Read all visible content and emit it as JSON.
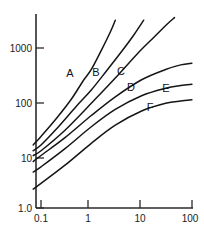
{
  "chart_data": {
    "type": "line",
    "title": "",
    "xlabel": "",
    "ylabel": "",
    "xscale": "log",
    "yscale": "log",
    "xlim": [
      0.07,
      100
    ],
    "ylim": [
      1.0,
      4000
    ],
    "grid": false,
    "legend": "inline-curve-labels",
    "x_tick_labels": [
      "0.1",
      "1",
      "10",
      "100"
    ],
    "x_tick_values": [
      0.1,
      1,
      10,
      100
    ],
    "y_tick_labels": [
      "1.0",
      "10",
      "100",
      "1000"
    ],
    "y_tick_values": [
      1,
      10,
      100,
      1000
    ],
    "series": [
      {
        "name": "A",
        "label": "A",
        "x": [
          0.07,
          0.1,
          0.2,
          0.4,
          0.7,
          1.0,
          1.6,
          2.4,
          3.0
        ],
        "values": [
          14,
          20,
          42,
          95,
          210,
          330,
          750,
          1600,
          2600
        ]
      },
      {
        "name": "B",
        "label": "B",
        "x": [
          0.07,
          0.1,
          0.2,
          0.5,
          1.0,
          2.0,
          4.0,
          7.0,
          11.0
        ],
        "values": [
          11,
          14,
          27,
          70,
          140,
          310,
          700,
          1400,
          2600
        ]
      },
      {
        "name": "C",
        "label": "C",
        "x": [
          0.07,
          0.1,
          0.3,
          1.0,
          3.0,
          8.0,
          18.0,
          32.0,
          45.0
        ],
        "values": [
          9,
          11,
          26,
          80,
          230,
          620,
          1300,
          2200,
          2900
        ]
      },
      {
        "name": "D",
        "label": "D",
        "x": [
          0.07,
          0.1,
          0.3,
          1.0,
          3.0,
          10.0,
          30.0,
          60.0,
          100.0
        ],
        "values": [
          7,
          9,
          19,
          48,
          105,
          215,
          330,
          400,
          430
        ]
      },
      {
        "name": "E",
        "label": "E",
        "x": [
          0.07,
          0.1,
          0.3,
          1.0,
          3.0,
          10.0,
          30.0,
          60.0,
          100.0
        ],
        "values": [
          4.5,
          5.6,
          12,
          30,
          62,
          110,
          150,
          168,
          178
        ]
      },
      {
        "name": "F",
        "label": "F",
        "x": [
          0.07,
          0.1,
          0.3,
          1.0,
          3.0,
          10.0,
          30.0,
          60.0,
          100.0
        ],
        "values": [
          2.2,
          2.8,
          6.0,
          15,
          32,
          58,
          80,
          88,
          93
        ]
      }
    ],
    "curve_label_positions": [
      {
        "name": "A",
        "x": 70,
        "y": 77
      },
      {
        "name": "B",
        "x": 96,
        "y": 76
      },
      {
        "name": "C",
        "x": 121,
        "y": 75
      },
      {
        "name": "D",
        "x": 131,
        "y": 91
      },
      {
        "name": "E",
        "x": 166,
        "y": 92
      },
      {
        "name": "F",
        "x": 150,
        "y": 111
      }
    ]
  },
  "axes": {
    "x_axis_name": "x-axis",
    "y_axis_name": "y-axis"
  }
}
